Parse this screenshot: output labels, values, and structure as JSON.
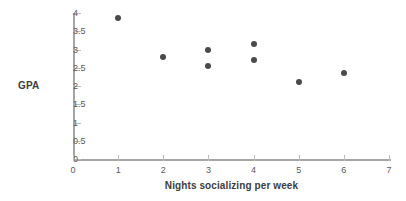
{
  "chart_data": {
    "type": "scatter",
    "title": "",
    "xlabel": "Nights socializing per week",
    "ylabel": "GPA",
    "xlim": [
      0,
      7
    ],
    "ylim": [
      0,
      4
    ],
    "grid": false,
    "legend": false,
    "xticks": [
      "0",
      "1",
      "2",
      "3",
      "4",
      "5",
      "6",
      "7"
    ],
    "yticks": [
      "0",
      "0.5",
      "1",
      "1.5",
      "2",
      "2.5",
      "3",
      "3.5",
      "4"
    ],
    "marker_color": "#4a4a4a",
    "axis_color": "#a6a6a6",
    "points": [
      {
        "x": 1,
        "y": 3.85
      },
      {
        "x": 2,
        "y": 2.8
      },
      {
        "x": 3,
        "y": 3.0
      },
      {
        "x": 3,
        "y": 2.55
      },
      {
        "x": 4,
        "y": 3.15
      },
      {
        "x": 4,
        "y": 2.7
      },
      {
        "x": 5,
        "y": 2.1
      },
      {
        "x": 6,
        "y": 2.35
      }
    ]
  }
}
